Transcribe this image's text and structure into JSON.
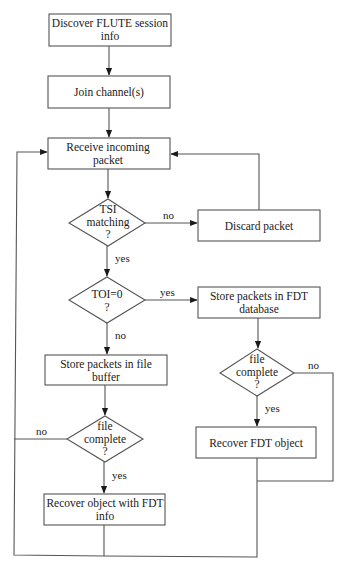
{
  "diagram": {
    "type": "flowchart",
    "nodes": {
      "discover": {
        "shape": "process",
        "lines": [
          "Discover FLUTE session",
          "info"
        ]
      },
      "join": {
        "shape": "process",
        "lines": [
          "Join channel(s)"
        ]
      },
      "receive": {
        "shape": "process",
        "lines": [
          "Receive incoming",
          "packet"
        ]
      },
      "tsi": {
        "shape": "decision",
        "lines": [
          "TSI",
          "matching",
          "?"
        ]
      },
      "discard": {
        "shape": "process",
        "lines": [
          "Discard packet"
        ]
      },
      "toi": {
        "shape": "decision",
        "lines": [
          "TOI=0",
          "?"
        ]
      },
      "store_fdt": {
        "shape": "process",
        "lines": [
          "Store packets in FDT",
          "database"
        ]
      },
      "fdt_complete": {
        "shape": "decision",
        "lines": [
          "file",
          "complete",
          "?"
        ]
      },
      "recover_fdt": {
        "shape": "process",
        "lines": [
          "Recover FDT object"
        ]
      },
      "store_file": {
        "shape": "process",
        "lines": [
          "Store packets in file",
          "buffer"
        ]
      },
      "file_complete": {
        "shape": "decision",
        "lines": [
          "file",
          "complete",
          "?"
        ]
      },
      "recover_object": {
        "shape": "process",
        "lines": [
          "Recover object with FDT",
          "info"
        ]
      }
    },
    "edges": [
      {
        "from": "discover",
        "to": "join",
        "label": ""
      },
      {
        "from": "join",
        "to": "receive",
        "label": ""
      },
      {
        "from": "receive",
        "to": "tsi",
        "label": ""
      },
      {
        "from": "tsi",
        "to": "discard",
        "label": "no"
      },
      {
        "from": "tsi",
        "to": "toi",
        "label": "yes"
      },
      {
        "from": "discard",
        "to": "receive",
        "label": ""
      },
      {
        "from": "toi",
        "to": "store_fdt",
        "label": "yes"
      },
      {
        "from": "toi",
        "to": "store_file",
        "label": "no"
      },
      {
        "from": "store_fdt",
        "to": "fdt_complete",
        "label": ""
      },
      {
        "from": "fdt_complete",
        "to": "recover_fdt",
        "label": "yes"
      },
      {
        "from": "fdt_complete",
        "to": "receive",
        "label": "no"
      },
      {
        "from": "recover_fdt",
        "to": "receive",
        "label": ""
      },
      {
        "from": "store_file",
        "to": "file_complete",
        "label": ""
      },
      {
        "from": "file_complete",
        "to": "recover_object",
        "label": "yes"
      },
      {
        "from": "file_complete",
        "to": "receive",
        "label": "no"
      },
      {
        "from": "recover_object",
        "to": "receive",
        "label": ""
      }
    ],
    "labels": {
      "tsi_no": "no",
      "tsi_yes": "yes",
      "toi_yes": "yes",
      "toi_no": "no",
      "fdt_complete_no": "no",
      "fdt_complete_yes": "yes",
      "file_complete_no": "no",
      "file_complete_yes": "yes"
    }
  }
}
